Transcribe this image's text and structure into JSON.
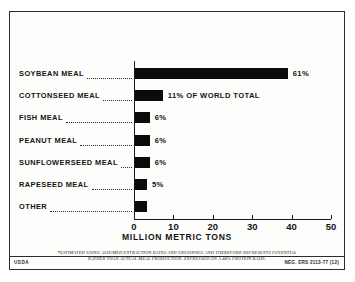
{
  "chart_data": {
    "type": "bar",
    "orientation": "horizontal",
    "title": "",
    "xlabel": "MILLION METRIC TONS",
    "ylabel": "",
    "xlim": [
      0,
      50
    ],
    "xticks": [
      0,
      10,
      20,
      30,
      40,
      50
    ],
    "xtick_labels": [
      "0",
      "10",
      "20",
      "30",
      "40",
      "50"
    ],
    "grid": false,
    "legend": "none",
    "categories": [
      "SOYBEAN MEAL",
      "COTTONSEED MEAL",
      "FISH MEAL",
      "PEANUT MEAL",
      "SUNFLOWERSEED MEAL",
      "RAPESEED MEAL",
      "OTHER"
    ],
    "values": [
      39.0,
      7.3,
      4.0,
      4.0,
      4.0,
      3.3,
      3.2
    ],
    "value_labels": [
      "61%",
      "11% OF WORLD TOTAL",
      "6%",
      "6%",
      "6%",
      "5%",
      ""
    ],
    "bar_color": "#0b0b0b"
  },
  "rows": [
    {
      "label": "SOYBEAN MEAL",
      "value": 39.0,
      "value_label": "61%"
    },
    {
      "label": "COTTONSEED MEAL",
      "value": 7.3,
      "value_label": "11% OF WORLD TOTAL"
    },
    {
      "label": "FISH MEAL",
      "value": 4.0,
      "value_label": "6%"
    },
    {
      "label": "PEANUT MEAL",
      "value": 4.0,
      "value_label": "6%"
    },
    {
      "label": "SUNFLOWERSEED MEAL",
      "value": 4.0,
      "value_label": "6%"
    },
    {
      "label": "RAPESEED MEAL",
      "value": 3.3,
      "value_label": "5%"
    },
    {
      "label": "OTHER",
      "value": 3.2,
      "value_label": ""
    }
  ],
  "axis": {
    "xlabel": "MILLION METRIC TONS",
    "ticks": [
      "0",
      "10",
      "20",
      "30",
      "40",
      "50"
    ]
  },
  "footnote": {
    "marker": "*",
    "line1": "ESTIMATED USING ASSUMED EXTRACTION RATES AND CRUSHINGS AND THEREFORE REPRESENTS POTENTIAL",
    "line2": "RATHER THAN ACTUAL MEAL PRODUCTION.  EXPRESSED ON A 44% PROTEIN BASIS."
  },
  "credit": {
    "agency": "USDA",
    "negative": "NEG. ERS 2113-77 (12)"
  }
}
